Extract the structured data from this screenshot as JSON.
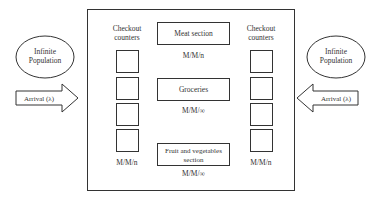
{
  "diagram": {
    "title": "",
    "left": {
      "population": {
        "line1": "Infinite",
        "line2": "Population"
      },
      "arrival": {
        "label": "Arrival (λ)",
        "direction": "right"
      }
    },
    "right": {
      "population": {
        "line1": "Infinite",
        "line2": "Population"
      },
      "arrival": {
        "label": "Arrival (λ)",
        "direction": "left"
      }
    },
    "store": {
      "left_counters": {
        "header_line1": "Checkout",
        "header_line2": "counters",
        "count": 4,
        "model": "M/M/n"
      },
      "right_counters": {
        "header_line1": "Checkout",
        "header_line2": "counters",
        "count": 4,
        "model": "M/M/n"
      },
      "sections": [
        {
          "line1": "Meat section",
          "line2": "",
          "model": "M/M/n"
        },
        {
          "line1": "Groceries",
          "line2": "",
          "model": "M/M/∞"
        },
        {
          "line1": "Fruit and vegetables",
          "line2": "section",
          "model": "M/M/∞"
        }
      ]
    },
    "colors": {
      "stroke": "#333333",
      "background": "#ffffff",
      "text": "#333333"
    }
  }
}
